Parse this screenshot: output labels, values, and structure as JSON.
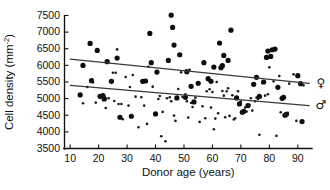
{
  "chart_data": {
    "type": "scatter",
    "title": "",
    "xlabel": "Donor age (years)",
    "ylabel": "Cell density (mm",
    "ylabel_sup": "-2",
    "ylabel_suffix": ")",
    "xlim": [
      8,
      95
    ],
    "ylim": [
      3500,
      7500
    ],
    "xticks": [
      10,
      20,
      30,
      40,
      50,
      60,
      70,
      80,
      90
    ],
    "xtick_labels": [
      "10",
      "20",
      "30",
      "40",
      "50",
      "60",
      "70",
      "80",
      "90"
    ],
    "yticks": [
      3500,
      4000,
      4500,
      5000,
      5500,
      6000,
      6500,
      7000,
      7500
    ],
    "ytick_labels": [
      "3500",
      "4000",
      "4500",
      "5000",
      "5500",
      "6000",
      "6500",
      "7000",
      "7500"
    ],
    "grid": false,
    "legend_position": "right-inline",
    "point_color": "#111111",
    "line_color": "#3a3a3a",
    "series": [
      {
        "name": "female",
        "symbol": "♀",
        "marker": "filled-circle-large",
        "marker_size": 2.6,
        "legend_label_y": 5450,
        "trend": {
          "x0": 10,
          "y0": 6190,
          "x1": 94,
          "y1": 5460
        },
        "points": [
          [
            13.5,
            5110
          ],
          [
            14.5,
            6000
          ],
          [
            17.0,
            6660
          ],
          [
            17.5,
            5540
          ],
          [
            19.5,
            6450
          ],
          [
            20.5,
            5070
          ],
          [
            21.5,
            5090
          ],
          [
            22.0,
            4990
          ],
          [
            23.0,
            6110
          ],
          [
            24.5,
            5520
          ],
          [
            26.5,
            6220
          ],
          [
            27.5,
            4440
          ],
          [
            31.5,
            4470
          ],
          [
            35.5,
            5520
          ],
          [
            36.5,
            5530
          ],
          [
            38.0,
            6960
          ],
          [
            38.5,
            6080
          ],
          [
            40.0,
            4540
          ],
          [
            40.5,
            5800
          ],
          [
            44.5,
            6150
          ],
          [
            45.5,
            7510
          ],
          [
            46.0,
            7140
          ],
          [
            46.5,
            6610
          ],
          [
            47.5,
            5020
          ],
          [
            48.5,
            6320
          ],
          [
            50.5,
            5040
          ],
          [
            51.0,
            5810
          ],
          [
            52.5,
            5370
          ],
          [
            53.5,
            4900
          ],
          [
            55.0,
            5460
          ],
          [
            57.0,
            6080
          ],
          [
            58.5,
            5600
          ],
          [
            59.5,
            5520
          ],
          [
            60.5,
            5950
          ],
          [
            62.5,
            6670
          ],
          [
            63.0,
            5930
          ],
          [
            63.5,
            5990
          ],
          [
            64.0,
            6300
          ],
          [
            65.5,
            6150
          ],
          [
            66.5,
            7060
          ],
          [
            68.5,
            5020
          ],
          [
            69.5,
            4840
          ],
          [
            70.5,
            4590
          ],
          [
            71.0,
            4620
          ],
          [
            72.5,
            4790
          ],
          [
            74.5,
            5430
          ],
          [
            75.5,
            5640
          ],
          [
            76.5,
            5070
          ],
          [
            78.0,
            5500
          ],
          [
            79.0,
            6240
          ],
          [
            79.5,
            6430
          ],
          [
            80.5,
            6270
          ],
          [
            81.0,
            6470
          ],
          [
            82.0,
            6490
          ],
          [
            83.0,
            5340
          ],
          [
            84.5,
            5010
          ],
          [
            85.0,
            5040
          ],
          [
            85.5,
            4500
          ],
          [
            86.0,
            4530
          ],
          [
            90.0,
            5690
          ],
          [
            91.0,
            5450
          ],
          [
            91.5,
            4310
          ]
        ]
      },
      {
        "name": "male",
        "symbol": "♂",
        "marker": "filled-circle-small",
        "marker_size": 1.3,
        "legend_label_y": 4800,
        "trend": {
          "x0": 10,
          "y0": 5400,
          "x1": 94,
          "y1": 4790
        },
        "points": [
          [
            14.5,
            4860
          ],
          [
            16.0,
            5350
          ],
          [
            17.5,
            5520
          ],
          [
            18.0,
            5490
          ],
          [
            19.0,
            4880
          ],
          [
            20.5,
            5020
          ],
          [
            21.0,
            5100
          ],
          [
            21.5,
            4960
          ],
          [
            22.0,
            5060
          ],
          [
            22.5,
            4720
          ],
          [
            23.5,
            5010
          ],
          [
            24.0,
            5530
          ],
          [
            25.0,
            5780
          ],
          [
            25.5,
            4930
          ],
          [
            26.0,
            5780
          ],
          [
            26.5,
            6480
          ],
          [
            27.0,
            4840
          ],
          [
            28.0,
            4840
          ],
          [
            28.5,
            4380
          ],
          [
            29.5,
            5650
          ],
          [
            30.5,
            4790
          ],
          [
            31.0,
            5350
          ],
          [
            32.0,
            5710
          ],
          [
            33.0,
            5060
          ],
          [
            34.0,
            4140
          ],
          [
            35.0,
            5040
          ],
          [
            36.0,
            4790
          ],
          [
            37.0,
            4240
          ],
          [
            37.5,
            5960
          ],
          [
            39.0,
            5360
          ],
          [
            41.0,
            4990
          ],
          [
            41.5,
            5080
          ],
          [
            42.0,
            3870
          ],
          [
            42.5,
            4600
          ],
          [
            43.5,
            3720
          ],
          [
            44.0,
            5010
          ],
          [
            45.0,
            5040
          ],
          [
            45.5,
            4920
          ],
          [
            46.5,
            4490
          ],
          [
            47.0,
            4330
          ],
          [
            48.0,
            5290
          ],
          [
            49.0,
            5790
          ],
          [
            49.5,
            5050
          ],
          [
            50.5,
            5130
          ],
          [
            51.0,
            4920
          ],
          [
            51.5,
            4430
          ],
          [
            52.0,
            5870
          ],
          [
            52.5,
            4870
          ],
          [
            53.0,
            4750
          ],
          [
            54.0,
            5030
          ],
          [
            55.5,
            4300
          ],
          [
            56.5,
            4770
          ],
          [
            57.5,
            4410
          ],
          [
            58.0,
            5220
          ],
          [
            59.0,
            5280
          ],
          [
            59.5,
            4730
          ],
          [
            60.0,
            5200
          ],
          [
            60.5,
            4080
          ],
          [
            61.0,
            4400
          ],
          [
            61.5,
            5500
          ],
          [
            62.0,
            4560
          ],
          [
            63.5,
            5230
          ],
          [
            64.0,
            5090
          ],
          [
            64.5,
            4440
          ],
          [
            65.0,
            5220
          ],
          [
            65.5,
            5310
          ],
          [
            66.0,
            4480
          ],
          [
            67.0,
            5100
          ],
          [
            67.5,
            4370
          ],
          [
            68.0,
            4410
          ],
          [
            69.0,
            5220
          ],
          [
            70.0,
            4910
          ],
          [
            70.5,
            4560
          ],
          [
            71.5,
            4730
          ],
          [
            72.0,
            4610
          ],
          [
            73.0,
            4810
          ],
          [
            73.5,
            5010
          ],
          [
            74.0,
            4640
          ],
          [
            75.0,
            4920
          ],
          [
            75.5,
            5030
          ],
          [
            76.0,
            4990
          ],
          [
            76.5,
            3910
          ],
          [
            77.0,
            5040
          ],
          [
            77.5,
            5470
          ],
          [
            78.5,
            5090
          ],
          [
            79.5,
            5130
          ],
          [
            80.0,
            5940
          ],
          [
            81.5,
            5520
          ],
          [
            82.5,
            3880
          ],
          [
            83.5,
            5680
          ],
          [
            84.0,
            4590
          ],
          [
            85.5,
            4540
          ],
          [
            86.5,
            4570
          ],
          [
            87.0,
            5450
          ],
          [
            88.5,
            5730
          ],
          [
            89.5,
            4330
          ],
          [
            90.5,
            5470
          ],
          [
            92.0,
            5400
          ]
        ]
      }
    ]
  }
}
